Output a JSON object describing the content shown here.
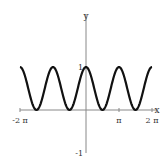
{
  "chart_data": {
    "type": "line",
    "title": "",
    "function": "cos(x)^2",
    "xlabel": "x",
    "ylabel": "y",
    "xlim": [
      -6.2832,
      6.2832
    ],
    "ylim": [
      -1,
      1.6
    ],
    "x_ticks": [
      {
        "value": -6.2832,
        "label": "-2 π"
      },
      {
        "value": 3.1416,
        "label": "π"
      },
      {
        "value": 6.2832,
        "label": "2 π"
      }
    ],
    "y_ticks": [
      {
        "value": 1,
        "label": "1"
      },
      {
        "value": -1,
        "label": "-1"
      }
    ],
    "grid": false,
    "legend": null,
    "series": [
      {
        "name": "cos^2(x)",
        "color": "#111111",
        "x": [
          -6.2832,
          -5.4978,
          -4.7124,
          -3.927,
          -3.1416,
          -2.3562,
          -1.5708,
          -0.7854,
          0,
          0.7854,
          1.5708,
          2.3562,
          3.1416,
          3.927,
          4.7124,
          5.4978,
          6.2832
        ],
        "values": [
          1,
          0.5,
          0,
          0.5,
          1,
          0.5,
          0,
          0.5,
          1,
          0.5,
          0,
          0.5,
          1,
          0.5,
          0,
          0.5,
          1
        ]
      }
    ]
  }
}
